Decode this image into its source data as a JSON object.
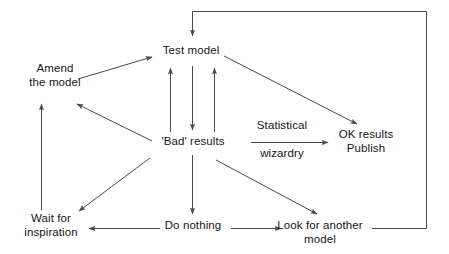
{
  "diagram": {
    "stroke_color": "#4a4a4a",
    "text_color": "#161616",
    "background_color": "#ffffff",
    "nodes": [
      {
        "id": "test-model",
        "label": "Test model"
      },
      {
        "id": "amend",
        "label": "Amend\nthe model"
      },
      {
        "id": "bad-results",
        "label": "'Bad' results"
      },
      {
        "id": "ok-results",
        "label": "OK results\nPublish"
      },
      {
        "id": "wait",
        "label": "Wait for\ninspiration"
      },
      {
        "id": "do-nothing",
        "label": "Do nothing"
      },
      {
        "id": "look",
        "label": "Look for another\nmodel"
      }
    ],
    "edge_labels": [
      {
        "id": "statistical",
        "label": "Statistical"
      },
      {
        "id": "wizardry",
        "label": "wizardry"
      }
    ],
    "edges": [
      {
        "from": "feedback-loop",
        "to": "test-model",
        "kind": "orthogonal-arrow"
      },
      {
        "from": "amend",
        "to": "test-model",
        "kind": "diagonal-arrow"
      },
      {
        "from": "bad-results",
        "to": "test-model",
        "kind": "vertical-arrow-up-left"
      },
      {
        "from": "test-model",
        "to": "bad-results",
        "kind": "vertical-arrow-down"
      },
      {
        "from": "bad-results",
        "to": "test-model",
        "kind": "vertical-arrow-up-right"
      },
      {
        "from": "test-model",
        "to": "ok-results",
        "kind": "diagonal-arrow"
      },
      {
        "from": "bad-results",
        "to": "amend",
        "kind": "diagonal-arrow"
      },
      {
        "from": "bad-results",
        "to": "ok-results",
        "kind": "horizontal-arrow-labelled"
      },
      {
        "from": "bad-results",
        "to": "wait",
        "kind": "diagonal-arrow"
      },
      {
        "from": "bad-results",
        "to": "do-nothing",
        "kind": "vertical-arrow-down"
      },
      {
        "from": "bad-results",
        "to": "look",
        "kind": "diagonal-arrow"
      },
      {
        "from": "wait",
        "to": "amend",
        "kind": "vertical-arrow-up"
      },
      {
        "from": "do-nothing",
        "to": "wait",
        "kind": "horizontal-arrow-left"
      },
      {
        "from": "do-nothing",
        "to": "look",
        "kind": "horizontal-arrow-right"
      },
      {
        "from": "look",
        "to": "test-model",
        "kind": "orthogonal-feedback"
      }
    ]
  }
}
